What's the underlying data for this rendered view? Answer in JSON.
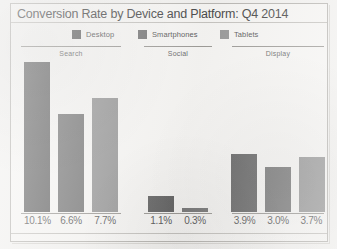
{
  "chart_data": {
    "type": "bar",
    "title": "Conversion Rate by Device and Platform: Q4 2014",
    "xlabel": "",
    "ylabel": "",
    "ylim": [
      0,
      10.1
    ],
    "grid": false,
    "legend_position": "top",
    "categories": [
      "Search",
      "Social",
      "Display"
    ],
    "series": [
      {
        "name": "Desktop",
        "color": "#6a6a6a",
        "values": [
          10.1,
          1.1,
          3.9
        ],
        "labels": [
          "10.1%",
          "1.1%",
          "3.9%"
        ]
      },
      {
        "name": "Smartphones",
        "color": "#7b7b7b",
        "values": [
          6.6,
          0.3,
          3.0
        ],
        "labels": [
          "6.6%",
          "0.3%",
          "3.0%"
        ]
      },
      {
        "name": "Tablets",
        "color": "#9a9a9a",
        "values": [
          7.7,
          null,
          3.7
        ],
        "labels": [
          "7.7%",
          "",
          "3.7%"
        ]
      }
    ],
    "groups": [
      {
        "label": "Search",
        "bars": [
          {
            "series": "Desktop",
            "value": 10.1,
            "label": "10.1%",
            "color": "#6a6a6a"
          },
          {
            "series": "Smartphones",
            "value": 6.6,
            "label": "6.6%",
            "color": "#7b7b7b"
          },
          {
            "series": "Tablets",
            "value": 7.7,
            "label": "7.7%",
            "color": "#9a9a9a"
          }
        ]
      },
      {
        "label": "Social",
        "bars": [
          {
            "series": "Desktop",
            "value": 1.1,
            "label": "1.1%",
            "color": "#6a6a6a"
          },
          {
            "series": "Smartphones",
            "value": 0.3,
            "label": "0.3%",
            "color": "#7b7b7b"
          }
        ]
      },
      {
        "label": "Display",
        "bars": [
          {
            "series": "Desktop",
            "value": 3.9,
            "label": "3.9%",
            "color": "#6a6a6a"
          },
          {
            "series": "Smartphones",
            "value": 3.0,
            "label": "3.0%",
            "color": "#7b7b7b"
          },
          {
            "series": "Tablets",
            "value": 3.7,
            "label": "3.7%",
            "color": "#9a9a9a"
          }
        ]
      }
    ]
  }
}
